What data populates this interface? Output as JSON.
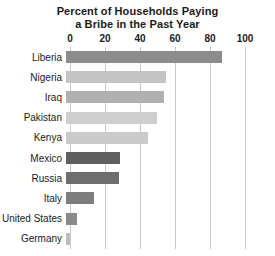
{
  "chart_data": {
    "type": "bar",
    "orientation": "horizontal",
    "title": "Percent of Households Paying a Bribe in the Past Year",
    "title_lines": [
      "Percent of Households Paying",
      "a Bribe in the Past Year"
    ],
    "xlabel": "",
    "ylabel": "",
    "xlim": [
      0,
      100
    ],
    "xticks": [
      0,
      20,
      40,
      60,
      80,
      100
    ],
    "xtick_labels": [
      "0",
      "20",
      "40",
      "60",
      "80",
      "100"
    ],
    "grid": "vertical",
    "legend": "none",
    "categories": [
      "Liberia",
      "Nigeria",
      "Iraq",
      "Pakistan",
      "Kenya",
      "Mexico",
      "Russia",
      "Italy",
      "United States",
      "Germany"
    ],
    "values": [
      89,
      57,
      56,
      52,
      47,
      31,
      30,
      16,
      6,
      2
    ],
    "bar_colors": [
      "#8c8c8c",
      "#c4c4c4",
      "#b0b0b0",
      "#cecece",
      "#cacaca",
      "#5f5f5f",
      "#6e6e6e",
      "#7d7d7d",
      "#8a8a8a",
      "#bdbdbd"
    ]
  },
  "style": {
    "gridline_color": "#c9c9c9",
    "title_color": "#1a1a1a",
    "label_color": "#1a1a1a",
    "background": "#ffffff"
  }
}
